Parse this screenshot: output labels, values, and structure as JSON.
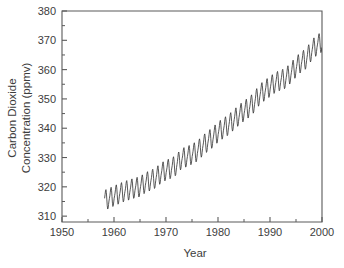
{
  "chart_data": {
    "type": "line",
    "title": "",
    "xlabel": "Year",
    "ylabel": "Carbon  Dioxide Concentration (ppmv)",
    "ylabel_line1": "Carbon  Dioxide",
    "ylabel_line2": "Concentration (ppmv)",
    "xlim": [
      1950,
      2000
    ],
    "ylim": [
      308,
      380
    ],
    "grid": false,
    "legend": null,
    "line_color": "#3b3b3b",
    "axis_color": "#5a5a5a",
    "background_color": "#ffffff",
    "x_ticks_major": [
      1950,
      1960,
      1970,
      1980,
      1990,
      2000
    ],
    "x_ticks_major_labels": [
      "1950",
      "1960",
      "1970",
      "1980",
      "1990",
      "2000"
    ],
    "x_ticks_minor": [
      1955,
      1965,
      1975,
      1985,
      1995
    ],
    "y_ticks_major": [
      310,
      320,
      330,
      340,
      350,
      360,
      370,
      380
    ],
    "y_ticks_major_labels": [
      "310",
      "320",
      "330",
      "340",
      "350",
      "360",
      "370",
      "380"
    ],
    "y_ticks_minor": [
      315,
      325,
      335,
      345,
      355,
      365,
      375
    ],
    "series_name": "Mauna Loa monthly mean CO2",
    "seasonal_amplitude_ppmv": 3.1,
    "data_start_year": 1958.2,
    "data_end_year": 2000.0,
    "annual_mean": {
      "x": [
        1958,
        1959,
        1960,
        1961,
        1962,
        1963,
        1964,
        1965,
        1966,
        1967,
        1968,
        1969,
        1970,
        1971,
        1972,
        1973,
        1974,
        1975,
        1976,
        1977,
        1978,
        1979,
        1980,
        1981,
        1982,
        1983,
        1984,
        1985,
        1986,
        1987,
        1988,
        1989,
        1990,
        1991,
        1992,
        1993,
        1994,
        1995,
        1996,
        1997,
        1998,
        1999,
        2000
      ],
      "y": [
        315.3,
        315.98,
        316.91,
        317.64,
        318.45,
        318.99,
        319.62,
        320.04,
        321.38,
        322.16,
        323.04,
        324.62,
        325.68,
        326.32,
        327.45,
        329.68,
        330.25,
        331.15,
        332.15,
        333.9,
        335.5,
        336.85,
        338.69,
        339.93,
        341.13,
        342.78,
        344.42,
        345.9,
        347.15,
        348.93,
        351.48,
        352.91,
        354.19,
        355.59,
        356.37,
        357.04,
        358.89,
        360.88,
        362.64,
        363.76,
        366.63,
        368.31,
        369.48
      ]
    }
  },
  "layout": {
    "plot_left_px": 62,
    "plot_right_px": 322,
    "plot_top_px": 11,
    "plot_bottom_px": 222
  }
}
